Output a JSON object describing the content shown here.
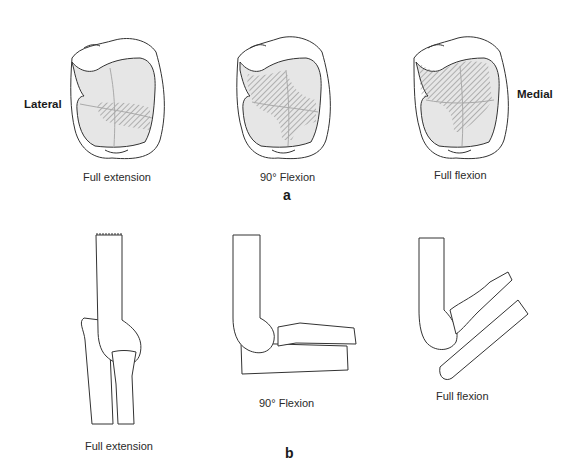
{
  "panel_a": {
    "label": "a",
    "side_left": "Lateral",
    "side_right": "Medial",
    "views": [
      {
        "caption": "Full extension"
      },
      {
        "caption": "90° Flexion"
      },
      {
        "caption": "Full flexion"
      }
    ]
  },
  "panel_b": {
    "label": "b",
    "views": [
      {
        "caption": "Full extension"
      },
      {
        "caption": "90° Flexion"
      },
      {
        "caption": "Full flexion"
      }
    ]
  },
  "colors": {
    "outline": "#333333",
    "cartilage_fill": "#e6e6e6",
    "hatch": "#777777"
  }
}
